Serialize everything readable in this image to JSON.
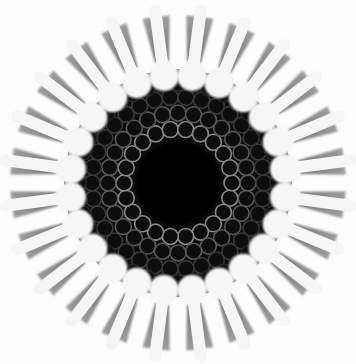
{
  "image": {
    "subject": "circular cross-section micrograph",
    "background_color": "#fdfdfd",
    "center": [
      178,
      183
    ],
    "core": {
      "radius": 42,
      "color": "#050505"
    },
    "dark_disk": {
      "radius": 104,
      "color": "#0a0a0a"
    },
    "cell_ring": {
      "inner_radius": 52,
      "outer_radius": 100,
      "cell_radius": 8,
      "color": "#6a6a6a"
    },
    "bulbs": {
      "count": 24,
      "orbit_radius": 108,
      "radius": 15,
      "color": "#f6f6f6"
    },
    "teeth": {
      "count": 24,
      "inner_radius": 122,
      "outer_radius": 168,
      "color": "#7a7a7a"
    }
  }
}
